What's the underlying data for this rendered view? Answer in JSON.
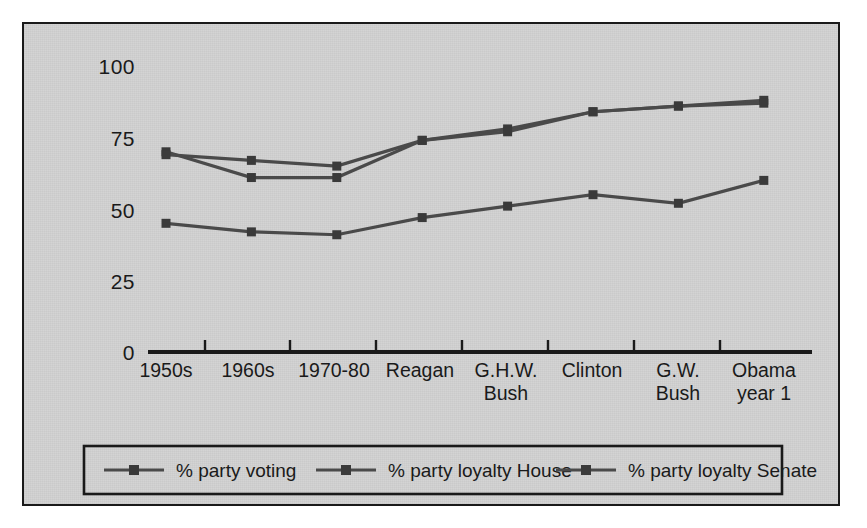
{
  "figure": {
    "background_color": "#d3d3d3",
    "page_color": "#ffffff",
    "frame_color": "#1a1a1a",
    "series_color": "#4a4a4a",
    "marker_color": "#3a3a3a"
  },
  "axes": {
    "y_ticks": [
      "0",
      "25",
      "50",
      "75",
      "100"
    ],
    "x_ticks": [
      {
        "line1": "1950s",
        "line2": ""
      },
      {
        "line1": "1960s",
        "line2": ""
      },
      {
        "line1": "1970-80",
        "line2": ""
      },
      {
        "line1": "Reagan",
        "line2": ""
      },
      {
        "line1": "G.H.W.",
        "line2": "Bush"
      },
      {
        "line1": "Clinton",
        "line2": ""
      },
      {
        "line1": "G.W.",
        "line2": "Bush"
      },
      {
        "line1": "Obama",
        "line2": "year 1"
      }
    ]
  },
  "legend": {
    "entries": [
      {
        "label": "% party voting",
        "marker": "square-line-marker"
      },
      {
        "label": "% party loyalty House",
        "marker": "square-line-marker"
      },
      {
        "label": "% party loyalty Senate",
        "marker": "square-line-marker"
      }
    ]
  },
  "chart_data": {
    "type": "line",
    "title": "",
    "subtitle": "",
    "xlabel": "",
    "ylabel": "",
    "categories": [
      "1950s",
      "1960s",
      "1970-80",
      "Reagan",
      "G.H.W. Bush",
      "Clinton",
      "G.W. Bush",
      "Obama year 1"
    ],
    "series": [
      {
        "name": "% party voting",
        "values": [
          45,
          42,
          41,
          47,
          51,
          55,
          52,
          60
        ]
      },
      {
        "name": "% party loyalty House",
        "values": [
          70,
          61,
          61,
          74,
          78,
          84,
          86,
          88
        ]
      },
      {
        "name": "% party loyalty Senate",
        "values": [
          69,
          67,
          65,
          74,
          77,
          84,
          86,
          87
        ]
      }
    ],
    "ylim": [
      0,
      100
    ],
    "yticks": [
      0,
      25,
      50,
      75,
      100
    ],
    "grid": false,
    "legend_position": "bottom"
  }
}
